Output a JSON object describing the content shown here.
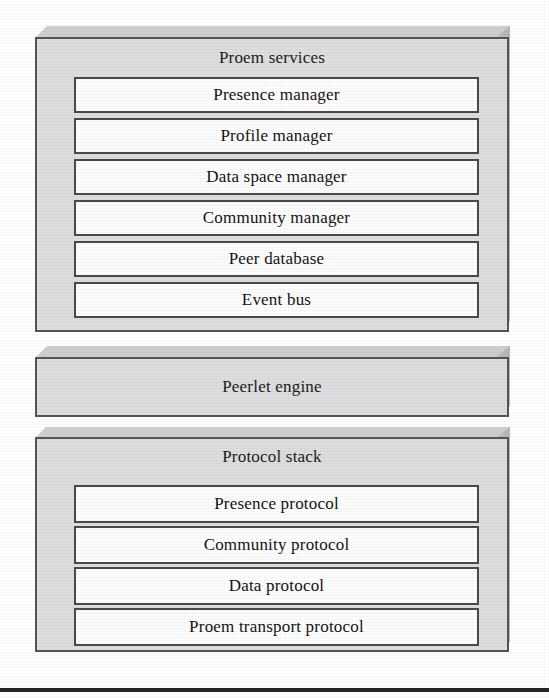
{
  "diagram": {
    "type": "layered-block-diagram",
    "colors": {
      "slab_fill": "#dedede",
      "slab_top_face": "#c9c9c9",
      "slab_right_face": "#bdbdbd",
      "row_fill": "#fdfdfd",
      "outline": "#555555",
      "row_outline": "#4a4a4a",
      "text": "#141414",
      "bottom_rule": "#262626",
      "page_background": "#ffffff"
    },
    "layers": [
      {
        "id": "proem-services",
        "label": "Proem services",
        "style": "extruded-block",
        "items": [
          {
            "label": "Presence manager"
          },
          {
            "label": "Profile manager"
          },
          {
            "label": "Data space manager"
          },
          {
            "label": "Community manager"
          },
          {
            "label": "Peer database"
          },
          {
            "label": "Event bus"
          }
        ]
      },
      {
        "id": "peerlet-engine",
        "label": "Peerlet engine",
        "style": "extruded-block",
        "items": []
      },
      {
        "id": "protocol-stack",
        "label": "Protocol stack",
        "style": "extruded-block",
        "items": [
          {
            "label": "Presence protocol"
          },
          {
            "label": "Community protocol"
          },
          {
            "label": "Data protocol"
          },
          {
            "label": "Proem transport protocol"
          }
        ]
      }
    ]
  }
}
